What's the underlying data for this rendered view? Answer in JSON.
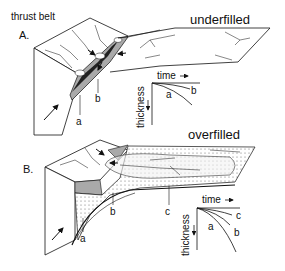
{
  "figure": {
    "panel_a": {
      "letter": "A.",
      "region_label": "thrust belt",
      "state_label": "underfilled",
      "markers": [
        "a",
        "b"
      ],
      "inset": {
        "x_label": "time",
        "y_label": "thickness",
        "curves": [
          "a",
          "b"
        ]
      }
    },
    "panel_b": {
      "letter": "B.",
      "state_label": "overfilled",
      "markers": [
        "a",
        "b",
        "c"
      ],
      "inset": {
        "x_label": "time",
        "y_label": "thickness",
        "curves": [
          "a",
          "b",
          "c"
        ]
      }
    },
    "colors": {
      "line": "#111111",
      "shade": "#a9a9a9",
      "dark_fill": "#222222",
      "stipple": "#d8d8d8",
      "background": "#ffffff"
    }
  }
}
